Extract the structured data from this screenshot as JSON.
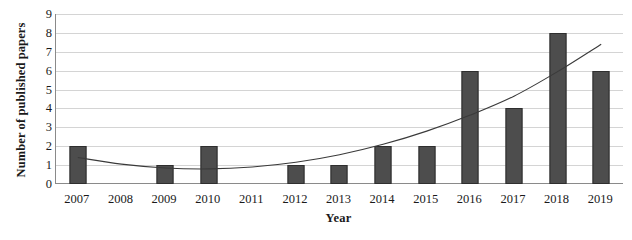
{
  "chart_data": {
    "type": "bar",
    "title": "",
    "subtitle": "",
    "xlabel": "Year",
    "ylabel": "Number of published papers",
    "categories": [
      "2007",
      "2008",
      "2009",
      "2010",
      "2011",
      "2012",
      "2013",
      "2014",
      "2015",
      "2016",
      "2017",
      "2018",
      "2019"
    ],
    "values": [
      2,
      0,
      1,
      2,
      0,
      1,
      1,
      2,
      2,
      6,
      4,
      8,
      6
    ],
    "ylim": [
      0,
      9
    ],
    "ytick_labels": [
      "0",
      "1",
      "2",
      "3",
      "4",
      "5",
      "6",
      "7",
      "8",
      "9"
    ],
    "grid": true,
    "legend": "none",
    "series": [
      {
        "name": "Number of published papers",
        "type": "bar",
        "values": [
          2,
          0,
          1,
          2,
          0,
          1,
          1,
          2,
          2,
          6,
          4,
          8,
          6
        ]
      },
      {
        "name": "Polynomial trend line",
        "type": "line",
        "values": [
          1.4,
          1.05,
          0.85,
          0.8,
          0.9,
          1.15,
          1.55,
          2.1,
          2.8,
          3.65,
          4.65,
          5.95,
          7.4
        ]
      }
    ],
    "colors": {
      "bar_fill": "#4d4d4d",
      "bar_border": "#2e2e2e",
      "trendline": "#3a3a3a",
      "gridline": "#d4d4d4",
      "axis": "#8a8a8a",
      "text": "#1a1a1a",
      "background": "#ffffff"
    }
  }
}
